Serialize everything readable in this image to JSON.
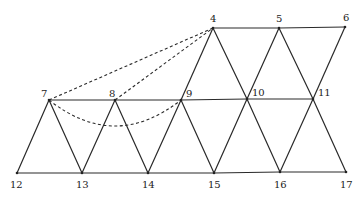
{
  "diagram": {
    "type": "graph",
    "vertices": [
      {
        "id": "4",
        "x": 213,
        "y": 28,
        "lx": 210,
        "ly": 22
      },
      {
        "id": "5",
        "x": 279,
        "y": 28,
        "lx": 276,
        "ly": 22
      },
      {
        "id": "6",
        "x": 345,
        "y": 27,
        "lx": 343,
        "ly": 21
      },
      {
        "id": "7",
        "x": 49,
        "y": 100,
        "lx": 41,
        "ly": 97
      },
      {
        "id": "8",
        "x": 115,
        "y": 100,
        "lx": 109,
        "ly": 97
      },
      {
        "id": "9",
        "x": 181,
        "y": 100,
        "lx": 186,
        "ly": 97
      },
      {
        "id": "10",
        "x": 247,
        "y": 99,
        "lx": 252,
        "ly": 96
      },
      {
        "id": "11",
        "x": 313,
        "y": 99,
        "lx": 318,
        "ly": 96
      },
      {
        "id": "12",
        "x": 17,
        "y": 173,
        "lx": 10,
        "ly": 188
      },
      {
        "id": "13",
        "x": 82,
        "y": 173,
        "lx": 76,
        "ly": 188
      },
      {
        "id": "14",
        "x": 148,
        "y": 173,
        "lx": 142,
        "ly": 188
      },
      {
        "id": "15",
        "x": 214,
        "y": 173,
        "lx": 208,
        "ly": 188
      },
      {
        "id": "16",
        "x": 280,
        "y": 172,
        "lx": 274,
        "ly": 188
      },
      {
        "id": "17",
        "x": 346,
        "y": 172,
        "lx": 340,
        "ly": 188
      }
    ],
    "solid_edges": [
      [
        "4",
        "5"
      ],
      [
        "5",
        "6"
      ],
      [
        "7",
        "8"
      ],
      [
        "8",
        "9"
      ],
      [
        "9",
        "10"
      ],
      [
        "10",
        "11"
      ],
      [
        "12",
        "13"
      ],
      [
        "13",
        "14"
      ],
      [
        "14",
        "15"
      ],
      [
        "15",
        "16"
      ],
      [
        "16",
        "17"
      ],
      [
        "4",
        "9"
      ],
      [
        "4",
        "10"
      ],
      [
        "5",
        "10"
      ],
      [
        "5",
        "11"
      ],
      [
        "6",
        "11"
      ],
      [
        "7",
        "12"
      ],
      [
        "7",
        "13"
      ],
      [
        "8",
        "13"
      ],
      [
        "8",
        "14"
      ],
      [
        "9",
        "14"
      ],
      [
        "9",
        "15"
      ],
      [
        "10",
        "15"
      ],
      [
        "10",
        "16"
      ],
      [
        "11",
        "16"
      ],
      [
        "11",
        "17"
      ]
    ],
    "dashed_edges": [
      [
        "7",
        "4"
      ],
      [
        "8",
        "4"
      ]
    ],
    "dashed_curves": [
      {
        "from": "7",
        "to": "9",
        "control": {
          "x": 115,
          "y": 152
        }
      }
    ]
  }
}
